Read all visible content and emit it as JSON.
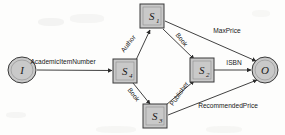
{
  "figure": {
    "background_color": "#fdfdfc",
    "node_fill_color": "#c9c9c9",
    "node_stroke_color": "#3a3a3a",
    "edge_color": "#2b2b2b"
  },
  "nodes": [
    {
      "id": "I",
      "label": "I",
      "subscript": "",
      "shape": "circle",
      "x": 22,
      "y": 70,
      "rx": 14,
      "ry": 13
    },
    {
      "id": "S4",
      "label": "S",
      "subscript": "4",
      "shape": "box",
      "x": 125,
      "y": 71,
      "w": 24,
      "h": 24
    },
    {
      "id": "S1",
      "label": "S",
      "subscript": "1",
      "shape": "box",
      "x": 152,
      "y": 16,
      "w": 24,
      "h": 24
    },
    {
      "id": "S2",
      "label": "S",
      "subscript": "2",
      "shape": "box",
      "x": 202,
      "y": 70,
      "w": 24,
      "h": 24
    },
    {
      "id": "S3",
      "label": "S",
      "subscript": "3",
      "shape": "box",
      "x": 155,
      "y": 116,
      "w": 24,
      "h": 24
    },
    {
      "id": "O",
      "label": "O",
      "subscript": "",
      "shape": "circle",
      "x": 265,
      "y": 70,
      "rx": 13,
      "ry": 13
    }
  ],
  "edges": [
    {
      "id": "e1",
      "from": "I",
      "to": "S4",
      "label": "AcademicItemNumber",
      "label_x": 63,
      "label_y": 64,
      "rotation": 0,
      "anchor": "middle"
    },
    {
      "id": "e2",
      "from": "S4",
      "to": "S1",
      "label": "Author",
      "label_x": 130,
      "label_y": 45,
      "rotation": -52,
      "anchor": "middle"
    },
    {
      "id": "e3",
      "from": "S1",
      "to": "S2",
      "label": "Book",
      "label_x": 180,
      "label_y": 41,
      "rotation": 52,
      "anchor": "middle"
    },
    {
      "id": "e4",
      "from": "S4",
      "to": "S3",
      "label": "Book",
      "label_x": 132,
      "label_y": 96,
      "rotation": 52,
      "anchor": "middle"
    },
    {
      "id": "e5",
      "from": "S3",
      "to": "S2",
      "label": "Publisher",
      "label_x": 181,
      "label_y": 95,
      "rotation": -55,
      "anchor": "middle"
    },
    {
      "id": "e6",
      "from": "S1",
      "to": "O",
      "label": "MaxPrice",
      "label_x": 227,
      "label_y": 33,
      "rotation": 0,
      "anchor": "middle"
    },
    {
      "id": "e7",
      "from": "S2",
      "to": "O",
      "label": "ISBN",
      "label_x": 234,
      "label_y": 65,
      "rotation": 0,
      "anchor": "middle"
    },
    {
      "id": "e8",
      "from": "S3",
      "to": "O",
      "label": "RecommendedPrice",
      "label_x": 228,
      "label_y": 108,
      "rotation": 0,
      "anchor": "middle"
    }
  ]
}
